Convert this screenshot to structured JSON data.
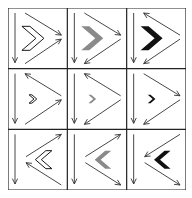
{
  "puzzle": {
    "rows": 3,
    "cols": 3,
    "colors": {
      "outline": "#1a1a1a",
      "gray": "#8a8a8a",
      "black": "#111111",
      "line": "#333333",
      "border": "#222222"
    },
    "cells": [
      {
        "row": 1,
        "col": 1,
        "chevron": {
          "fill": "outline",
          "size": "large",
          "direction": "right"
        },
        "arrows": {
          "vertical": "down",
          "upper": "right",
          "lower": "right"
        },
        "layout": "converge-right"
      },
      {
        "row": 1,
        "col": 2,
        "chevron": {
          "fill": "gray",
          "size": "large",
          "direction": "right"
        },
        "arrows": {
          "vertical": "down",
          "upper": "right",
          "lower": "left"
        },
        "layout": "converge-right"
      },
      {
        "row": 1,
        "col": 3,
        "chevron": {
          "fill": "black",
          "size": "large",
          "direction": "right"
        },
        "arrows": {
          "vertical": "down",
          "upper": "left",
          "lower": "left"
        },
        "layout": "converge-right"
      },
      {
        "row": 2,
        "col": 1,
        "chevron": {
          "fill": "outline",
          "size": "small",
          "direction": "right"
        },
        "arrows": {
          "vertical": "down",
          "upper": "left",
          "lower": "right"
        },
        "layout": "converge-right"
      },
      {
        "row": 2,
        "col": 2,
        "chevron": {
          "fill": "gray",
          "size": "small",
          "direction": "right"
        },
        "arrows": {
          "vertical": "down",
          "upper": "left",
          "lower": "left"
        },
        "layout": "converge-right"
      },
      {
        "row": 2,
        "col": 3,
        "chevron": {
          "fill": "black",
          "size": "small",
          "direction": "right"
        },
        "arrows": {
          "vertical": "down",
          "upper": "right",
          "lower": "left"
        },
        "layout": "converge-right"
      },
      {
        "row": 3,
        "col": 1,
        "chevron": {
          "fill": "outline",
          "size": "medium",
          "direction": "left"
        },
        "arrows": {
          "vertical": "down",
          "upper": "right",
          "lower": "left"
        },
        "layout": "converge-left"
      },
      {
        "row": 3,
        "col": 2,
        "chevron": {
          "fill": "gray",
          "size": "medium",
          "direction": "left"
        },
        "arrows": {
          "vertical": "down",
          "upper": "right",
          "lower": "right"
        },
        "layout": "converge-left"
      },
      {
        "row": 3,
        "col": 3,
        "chevron": {
          "fill": "black",
          "size": "medium",
          "direction": "left"
        },
        "arrows": {
          "vertical": "down",
          "upper": "left",
          "lower": "right"
        },
        "layout": "converge-left"
      }
    ]
  }
}
